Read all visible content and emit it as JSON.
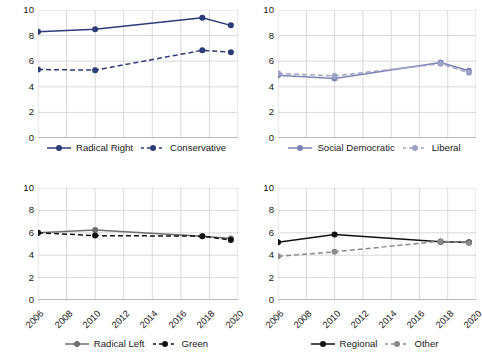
{
  "figure": {
    "ylabel": "Salience of Immigration",
    "ytick_labels": [
      "0",
      "2",
      "4",
      "6",
      "8",
      "10"
    ],
    "xtick_labels": [
      "2006",
      "2008",
      "2010",
      "2012",
      "2014",
      "2016",
      "2018",
      "2020"
    ]
  },
  "chart_data": [
    {
      "type": "line",
      "panel": "top-left",
      "title": "",
      "xlabel": "",
      "ylabel": "Salience of Immigration",
      "xlim": [
        2006,
        2020
      ],
      "ylim": [
        0,
        10
      ],
      "xticks": [
        2006,
        2008,
        2010,
        2012,
        2014,
        2016,
        2018,
        2020
      ],
      "yticks": [
        0,
        2,
        4,
        6,
        8,
        10
      ],
      "grid": true,
      "legend_position": "below",
      "x": [
        2006,
        2010,
        2017.5,
        2019.5
      ],
      "series": [
        {
          "name": "Radical Right",
          "values": [
            8.3,
            8.5,
            9.4,
            8.8
          ],
          "color": "#2c3b77",
          "style": "solid"
        },
        {
          "name": "Conservative",
          "values": [
            5.35,
            5.3,
            6.85,
            6.7
          ],
          "color": "#2c3b77",
          "style": "dashed"
        }
      ]
    },
    {
      "type": "line",
      "panel": "top-right",
      "title": "",
      "xlabel": "",
      "ylabel": "",
      "xlim": [
        2006,
        2020
      ],
      "ylim": [
        0,
        10
      ],
      "xticks": [
        2006,
        2008,
        2010,
        2012,
        2014,
        2016,
        2018,
        2020
      ],
      "yticks": [
        0,
        2,
        4,
        6,
        8,
        10
      ],
      "grid": true,
      "legend_position": "below",
      "x": [
        2006,
        2010,
        2017.5,
        2019.5
      ],
      "series": [
        {
          "name": "Social Democratic",
          "values": [
            4.9,
            4.65,
            5.9,
            5.25
          ],
          "color": "#7c83b4",
          "style": "solid"
        },
        {
          "name": "Liberal",
          "values": [
            5.05,
            4.85,
            5.8,
            5.1
          ],
          "color": "#9ea3c6",
          "style": "dashed"
        }
      ]
    },
    {
      "type": "line",
      "panel": "bottom-left",
      "title": "",
      "xlabel": "",
      "ylabel": "",
      "xlim": [
        2006,
        2020
      ],
      "ylim": [
        0,
        10
      ],
      "xticks": [
        2006,
        2008,
        2010,
        2012,
        2014,
        2016,
        2018,
        2020
      ],
      "yticks": [
        0,
        2,
        4,
        6,
        8,
        10
      ],
      "grid": true,
      "legend_position": "below",
      "x": [
        2006,
        2010,
        2017.5,
        2019.5
      ],
      "series": [
        {
          "name": "Radical Left",
          "values": [
            6.0,
            6.25,
            5.7,
            5.5
          ],
          "color": "#6e6e6e",
          "style": "solid"
        },
        {
          "name": "Green",
          "values": [
            6.0,
            5.75,
            5.7,
            5.35
          ],
          "color": "#111111",
          "style": "dashed"
        }
      ]
    },
    {
      "type": "line",
      "panel": "bottom-right",
      "title": "",
      "xlabel": "",
      "ylabel": "",
      "xlim": [
        2006,
        2020
      ],
      "ylim": [
        0,
        10
      ],
      "xticks": [
        2006,
        2008,
        2010,
        2012,
        2014,
        2016,
        2018,
        2020
      ],
      "yticks": [
        0,
        2,
        4,
        6,
        8,
        10
      ],
      "grid": true,
      "legend_position": "below",
      "x": [
        2006,
        2010,
        2017.5,
        2019.5
      ],
      "series": [
        {
          "name": "Regional",
          "values": [
            5.15,
            5.85,
            5.2,
            5.15
          ],
          "color": "#111111",
          "style": "solid"
        },
        {
          "name": "Other",
          "values": [
            3.9,
            4.3,
            5.25,
            5.1
          ],
          "color": "#8a8a8a",
          "style": "dashed"
        }
      ]
    }
  ]
}
